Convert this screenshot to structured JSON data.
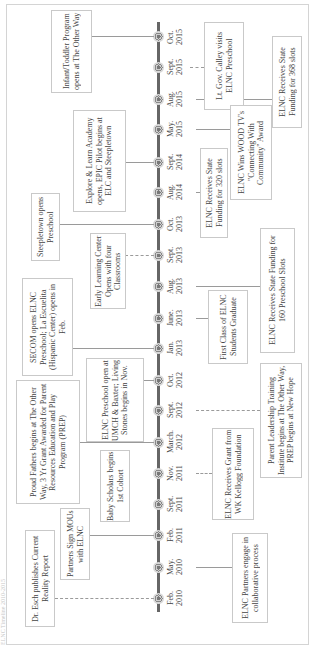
{
  "title": "ELNC Timeline 2010-2015",
  "timeline": {
    "axis_color": "#666666",
    "milestones": [
      {
        "id": "oct2015",
        "month": "Oct.",
        "year": "2015"
      },
      {
        "id": "sept2015",
        "month": "Sept.",
        "year": "2015"
      },
      {
        "id": "aug2015",
        "month": "Aug.",
        "year": "2015"
      },
      {
        "id": "may2015",
        "month": "May.",
        "year": "2015"
      },
      {
        "id": "sept2014",
        "month": "Sept.",
        "year": "2014"
      },
      {
        "id": "aug2014",
        "month": "Aug.",
        "year": "2014"
      },
      {
        "id": "oct2013",
        "month": "Oct.",
        "year": "2013"
      },
      {
        "id": "sept2013",
        "month": "Sept.",
        "year": "2013"
      },
      {
        "id": "aug2013",
        "month": "Aug.",
        "year": "2013"
      },
      {
        "id": "june2013",
        "month": "June.",
        "year": "2013"
      },
      {
        "id": "jan2013",
        "month": "Jan.",
        "year": "2013"
      },
      {
        "id": "oct2012",
        "month": "Oct.",
        "year": "2012"
      },
      {
        "id": "sept2012",
        "month": "Sept.",
        "year": "2012"
      },
      {
        "id": "march2012",
        "month": "March.",
        "year": "2012"
      },
      {
        "id": "nov2011",
        "month": "Nov.",
        "year": "2011"
      },
      {
        "id": "sept2011",
        "month": "Sept.",
        "year": "2011"
      },
      {
        "id": "feb2011",
        "month": "Feb.",
        "year": "2011"
      },
      {
        "id": "may2010",
        "month": "May.",
        "year": "2010"
      },
      {
        "id": "feb2010",
        "month": "Feb.",
        "year": "2010"
      }
    ],
    "events": [
      {
        "date": "Oct. 2015",
        "side": "left",
        "text": "Infant/Toddler Program opens at The Other Way"
      },
      {
        "date": "Sept. 2015",
        "side": "right",
        "text": "Lt. Gov. Calley visits ELNC Preschool"
      },
      {
        "date": "Aug. 2015",
        "side": "right",
        "text": "ELNC Receives State Funding for 368 slots"
      },
      {
        "date": "May. 2015",
        "side": "right",
        "text": "ELNC Wins WOOD TV's \"Connecting With Community\" Award"
      },
      {
        "date": "Sept. 2014",
        "side": "left",
        "text": "Explore & Learn Academy opens, EPIC Pilot begins at ELC and Steepletown"
      },
      {
        "date": "Aug. 2014",
        "side": "right",
        "text": "ELNC Receives State Funding for 320 slots"
      },
      {
        "date": "Oct. 2013",
        "side": "left",
        "text": "Steepletown opens Preschool"
      },
      {
        "date": "Sept. 2013",
        "side": "left",
        "text": "Early Learning Center Opens with four Classrooms"
      },
      {
        "date": "Aug. 2013",
        "side": "right",
        "text": "ELNC Receives State Funding for 160 Preschool Slots"
      },
      {
        "date": "June. 2013",
        "side": "right",
        "text": "First Class of ELNC Students Graduate"
      },
      {
        "date": "Jan. 2013",
        "side": "left",
        "text": "SECOM opens ELNC Preschool; La Escuelita (Hispanic Center) opens in Feb."
      },
      {
        "date": "Oct. 2012",
        "side": "left",
        "text": "ELNC Preschool open at UMCH & Baxter; Living Stones begins in Nov."
      },
      {
        "date": "Sept. 2012",
        "side": "right",
        "text": "Parent Leadership Training Institute begins at The Other Way, PREP begins at New Hope"
      },
      {
        "date": "March. 2012",
        "side": "left",
        "text": "Proud Fathers begins at The Other Way, 3 Yr Grant Awarded for Parent Resources Education and Play Program (PREP)"
      },
      {
        "date": "Nov. 2011",
        "side": "right",
        "text": "ELNC Receives Grant from WK Kellogg Foundation"
      },
      {
        "date": "Sept. 2011",
        "side": "left",
        "text": "Baby Scholars begins 1st Cohort"
      },
      {
        "date": "Feb. 2011",
        "side": "left",
        "text": "Partners Sign MOUs with ELNC"
      },
      {
        "date": "May. 2010",
        "side": "right",
        "text": "ELNC Partners engage in collaborative process"
      },
      {
        "date": "Feb. 2010",
        "side": "left",
        "text": "Dr. Esch publishes Current Reality Report"
      }
    ]
  }
}
